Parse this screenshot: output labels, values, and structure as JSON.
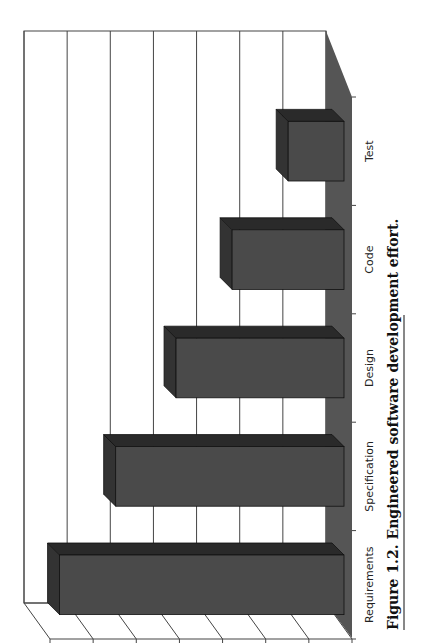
{
  "chart_data": {
    "type": "bar",
    "style": "3d-column, page rotated 90deg counter-clockwise",
    "title": "",
    "xlabel": "",
    "ylabel": "",
    "categories": [
      "Requirements",
      "Specification",
      "Design",
      "Code",
      "Test"
    ],
    "values": [
      32.5,
      26,
      19,
      12.5,
      6
    ],
    "value_unit": "%",
    "ylim": [
      0,
      35
    ],
    "yticks": [
      "0%",
      "5%",
      "10%",
      "15%",
      "20%",
      "25%",
      "30%",
      "35%"
    ],
    "grid": true,
    "legend": null
  },
  "caption": {
    "label": "Figure 1.2.",
    "text": "Engineered software development effort."
  },
  "colors": {
    "bar_front": "#4a4a4a",
    "bar_top": "#2a2a2a",
    "bar_side": "#333333",
    "floor": "#555555",
    "grid": "#444444"
  }
}
